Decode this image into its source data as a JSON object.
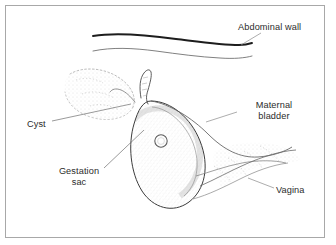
{
  "figure": {
    "kind": "medical-line-drawing",
    "background_color": "#ffffff",
    "frame_color": "#a8a8a8",
    "ink_color": "#2b2b2b",
    "stipple_color": "#9a9a9a"
  },
  "labels": {
    "abdominal_wall": "Abdominal wall",
    "maternal_bladder_line1": "Maternal",
    "maternal_bladder_line2": "bladder",
    "cyst": "Cyst",
    "gestation_sac_line1": "Gestation",
    "gestation_sac_line2": "sac",
    "vagina": "Vagina"
  },
  "structures": [
    {
      "name": "abdominal-wall",
      "description": "Two nearly parallel wavy horizontal lines across the upper third; upper line is thick and dark, lower line is thin."
    },
    {
      "name": "cyst",
      "description": "Faint stippled rounded mass in the upper-left quadrant, bounded by a dotted outline."
    },
    {
      "name": "gestation-sac",
      "description": "Large elongated oval tilted from upper-left to lower-right with shaded inner wall, containing a small ring."
    },
    {
      "name": "embryo-ring",
      "description": "Small circle inside the upper portion of the gestation sac."
    },
    {
      "name": "uterine-horn",
      "description": "Narrow curved tubular projection rising from the top of the gestation sac and hooking to the left."
    },
    {
      "name": "maternal-bladder",
      "description": "Region to the right of the gestation sac bounded by a long sweeping curve."
    },
    {
      "name": "vagina",
      "description": "Stippled channel running from the lower end of the uterus toward the lower right."
    }
  ],
  "leader_lines": [
    {
      "name": "abdominal-wall-leader",
      "from": "Abdominal wall label",
      "to": "upper thick wall line"
    },
    {
      "name": "maternal-bladder-leader",
      "from": "Maternal bladder label",
      "to": "bladder region"
    },
    {
      "name": "cyst-leader",
      "from": "Cyst label",
      "to": "stippled cyst mass"
    },
    {
      "name": "gestation-sac-leader",
      "from": "Gestation sac label",
      "to": "gestation sac wall"
    },
    {
      "name": "vagina-leader",
      "from": "Vagina label",
      "to": "vaginal channel"
    }
  ]
}
